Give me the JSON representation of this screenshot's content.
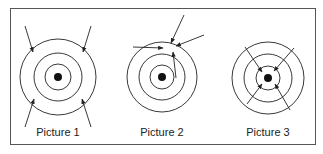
{
  "figure": {
    "border_color": "#555555",
    "stroke_color": "#222222",
    "pictures": [
      {
        "caption": "Picture 1",
        "description": "Arrows from four diagonal directions pointing at the outer ring",
        "center": [
          58,
          77
        ],
        "ring_radii": [
          13,
          24,
          38
        ],
        "dot_radius": 4
      },
      {
        "caption": "Picture 2",
        "description": "Three arrows converging on a single point near the top of the outer ring",
        "center": [
          162,
          77
        ],
        "ring_radii": [
          12,
          23,
          35
        ],
        "dot_radius": 4
      },
      {
        "caption": "Picture 3",
        "description": "Four diagonal arrows crossing the rings and pointing at the center dot",
        "center": [
          268,
          78
        ],
        "ring_radii": [
          12,
          24,
          36
        ],
        "dot_radius": 4
      }
    ]
  }
}
